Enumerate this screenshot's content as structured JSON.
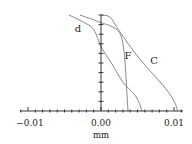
{
  "chart_data": {
    "type": "line",
    "title": "",
    "xlabel": "mm",
    "ylabel": "",
    "xlim": [
      -0.0125,
      0.0115
    ],
    "ylim": [
      0,
      1
    ],
    "grid": false,
    "legend": "inline curve labels",
    "x_tick_labels": [
      "-0.01",
      "0.00",
      "0.01"
    ],
    "x_ticks": [
      -0.01,
      0.0,
      0.01
    ],
    "x_minor_tick_step": 0.001,
    "y_minor_tick_count": 10,
    "series": [
      {
        "name": "d",
        "points": [
          [
            -0.0044,
            1.0
          ],
          [
            -0.0025,
            0.93
          ],
          [
            -0.001,
            0.85
          ],
          [
            0.0,
            0.67
          ],
          [
            0.0015,
            0.49
          ],
          [
            0.003,
            0.3
          ],
          [
            0.0045,
            0.18
          ],
          [
            0.0052,
            0.09
          ],
          [
            0.0056,
            0.0
          ]
        ]
      },
      {
        "name": "F",
        "points": [
          [
            -0.0029,
            1.0
          ],
          [
            -0.001,
            0.95
          ],
          [
            0.0,
            0.92
          ],
          [
            0.0015,
            0.88
          ],
          [
            0.0025,
            0.82
          ],
          [
            0.003,
            0.7
          ],
          [
            0.0033,
            0.5
          ],
          [
            0.0035,
            0.25
          ],
          [
            0.0037,
            0.0
          ]
        ]
      },
      {
        "name": "C",
        "points": [
          [
            0.0,
            1.0
          ],
          [
            0.0012,
            0.98
          ],
          [
            0.0022,
            0.87
          ],
          [
            0.003,
            0.78
          ],
          [
            0.0045,
            0.62
          ],
          [
            0.006,
            0.48
          ],
          [
            0.008,
            0.31
          ],
          [
            0.0095,
            0.17
          ],
          [
            0.0102,
            0.07
          ],
          [
            0.0105,
            0.0
          ]
        ]
      }
    ],
    "annotations": [
      "d",
      "F",
      "C"
    ]
  },
  "axis": {
    "x_labels": [
      "−0.01",
      "0.00",
      "0.01"
    ],
    "x_unit": "mm"
  },
  "curve_labels": {
    "d": "d",
    "F": "F",
    "C": "C"
  },
  "colors": {
    "curve": "#7a7a7a",
    "axis": "#222222"
  }
}
